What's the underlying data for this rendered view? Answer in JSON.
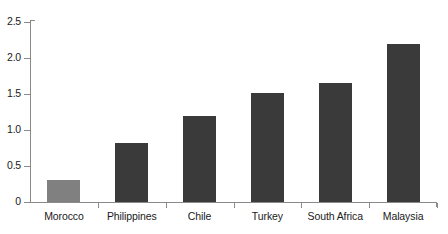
{
  "chart_data": {
    "type": "bar",
    "title": "",
    "subtitle": "",
    "xlabel": "",
    "ylabel": "",
    "categories": [
      "Morocco",
      "Philippines",
      "Chile",
      "Turkey",
      "South Africa",
      "Malaysia"
    ],
    "values": [
      0.3,
      0.82,
      1.2,
      1.52,
      1.65,
      2.2
    ],
    "ylim": [
      0,
      2.5
    ],
    "ytick_values": [
      0,
      0.5,
      1.0,
      1.5,
      2.0,
      2.5
    ],
    "ytick_labels": [
      "0",
      "0.5",
      "1.0",
      "1.5",
      "2.0",
      "2.5"
    ],
    "grid": false,
    "legend": null,
    "legend_position": "none",
    "annotations": [],
    "series": [
      {
        "name": "",
        "values": [
          0.3,
          0.82,
          1.2,
          1.52,
          1.65,
          2.2
        ],
        "colors": [
          "#808080",
          "#3a3a3a",
          "#3a3a3a",
          "#3a3a3a",
          "#3a3a3a",
          "#3a3a3a"
        ]
      }
    ],
    "colors": {
      "highlight_bar": "#808080",
      "bar": "#3a3a3a",
      "axis": "#8a8a8a",
      "text": "#1a1a1a",
      "background": "#ffffff"
    }
  }
}
